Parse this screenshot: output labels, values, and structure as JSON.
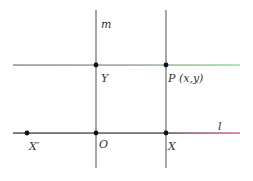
{
  "diagram": {
    "lines": {
      "m": {
        "label": "m",
        "kind": "vertical",
        "x": 96,
        "y1": 10,
        "y2": 168,
        "color": "#6b6b6b"
      },
      "pX": {
        "label": "",
        "kind": "vertical",
        "x": 166,
        "y1": 10,
        "y2": 168,
        "color": "#6b6b6b"
      },
      "top": {
        "label": "",
        "kind": "horizontal",
        "y": 65,
        "x1": 13,
        "x2": 240,
        "color_start": "#7d7d7d",
        "color_end": "#7fd88a"
      },
      "l": {
        "label": "l",
        "kind": "horizontal",
        "y": 133,
        "x1": 13,
        "x2": 240,
        "color_start": "#3a3a3a",
        "color_end": "#d0506a"
      }
    },
    "points": [
      {
        "name": "Y",
        "label": "Y",
        "x": 96,
        "y": 65
      },
      {
        "name": "P",
        "label": "P (x,y)",
        "x": 166,
        "y": 65
      },
      {
        "name": "X'",
        "label": "X′",
        "x": 27,
        "y": 133
      },
      {
        "name": "O",
        "label": "O",
        "x": 96,
        "y": 133
      },
      {
        "name": "X",
        "label": "X",
        "x": 166,
        "y": 133
      }
    ],
    "point_color": "#111111"
  }
}
